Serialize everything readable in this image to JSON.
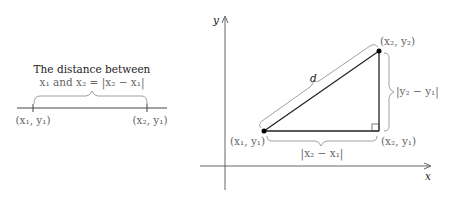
{
  "left_figure": {
    "title_line1": "The distance between",
    "title_line2": "x₁ and x₂ = |x₂ − x₁|",
    "point1_label": "(x₁, y₁)",
    "point2_label": "(x₂, y₁)"
  },
  "right_figure": {
    "y_axis_label": "y",
    "x_axis_label": "x",
    "hypotenuse_label": "d",
    "point1_label": "(x₁, y₁)",
    "point2_label": "(x₂, y₂)",
    "corner_label": "(x₂, y₁)",
    "horizontal_distance_label": "|x₂ − x₁|",
    "vertical_distance_label": "|y₂ − y₁|"
  }
}
